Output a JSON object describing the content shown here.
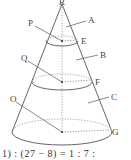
{
  "diagram": {
    "type": "cone-sections",
    "apex_label": "R",
    "regions": [
      {
        "label": "A",
        "part": "top small cone"
      },
      {
        "label": "B",
        "part": "middle frustum"
      },
      {
        "label": "C",
        "part": "bottom frustum"
      }
    ],
    "centers": [
      {
        "label": "P",
        "level": "top section"
      },
      {
        "label": "Q",
        "level": "middle section"
      },
      {
        "label": "O",
        "level": "base"
      }
    ],
    "rim_points": [
      {
        "label": "E",
        "level": "top section"
      },
      {
        "label": "F",
        "level": "middle section"
      },
      {
        "label": "G",
        "level": "base"
      }
    ],
    "colors": {
      "line": "#555555",
      "dotted": "#888888",
      "text": "#444444"
    }
  },
  "caption": "1) : (27 − 8) = 1 : 7 :"
}
